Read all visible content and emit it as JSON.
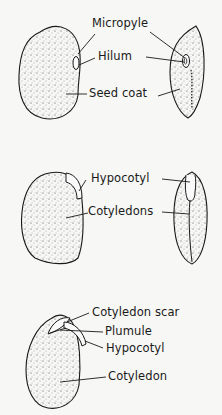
{
  "diagram": {
    "type": "bean seed anatomy",
    "panels": [
      {
        "id": "external",
        "labels": [
          {
            "key": "micropyle",
            "text": "Micropyle"
          },
          {
            "key": "hilum",
            "text": "Hilum"
          },
          {
            "key": "seed_coat",
            "text": "Seed coat"
          }
        ]
      },
      {
        "id": "seed_coat_removed",
        "labels": [
          {
            "key": "hypocotyl",
            "text": "Hypocotyl"
          },
          {
            "key": "cotyledons",
            "text": "Cotyledons"
          }
        ]
      },
      {
        "id": "cotyledon_opened",
        "labels": [
          {
            "key": "cotyledon_scar",
            "text": "Cotyledon scar"
          },
          {
            "key": "plumule",
            "text": "Plumule"
          },
          {
            "key": "hypocotyl",
            "text": "Hypocotyl"
          },
          {
            "key": "cotyledon",
            "text": "Cotyledon"
          }
        ]
      }
    ],
    "colors": {
      "ink": "#1a1a1a",
      "background": "#f7f7f5"
    }
  }
}
